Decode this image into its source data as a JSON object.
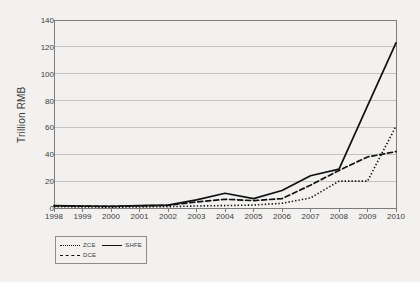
{
  "chart_data": {
    "type": "line",
    "title": "",
    "xlabel": "",
    "ylabel": "Trillion RMB",
    "categories": [
      "1998",
      "1999",
      "2000",
      "2001",
      "2002",
      "2003",
      "2004",
      "2005",
      "2006",
      "2007",
      "2008",
      "2009",
      "2010"
    ],
    "x": [
      1998,
      1999,
      2000,
      2001,
      2002,
      2003,
      2004,
      2005,
      2006,
      2007,
      2008,
      2009,
      2010
    ],
    "xlim": [
      1998,
      2010
    ],
    "ylim": [
      0,
      140
    ],
    "yticks": [
      0,
      20,
      40,
      60,
      80,
      100,
      120,
      140
    ],
    "ytick_labels": [
      "0",
      "20",
      "40",
      "60",
      "80",
      "100",
      "120",
      "140"
    ],
    "grid": "horizontal",
    "legend_position": "below-left",
    "series": [
      {
        "name": "ZCE",
        "style": "dotted",
        "color": "#111111",
        "values": [
          1.0,
          0.8,
          0.6,
          0.8,
          1.0,
          1.5,
          1.8,
          2.2,
          3.5,
          7.5,
          20.0,
          20.0,
          61.0
        ]
      },
      {
        "name": "DCE",
        "style": "dashed",
        "color": "#111111",
        "values": [
          1.6,
          1.4,
          1.2,
          1.6,
          2.0,
          4.5,
          6.5,
          5.5,
          7.0,
          17.0,
          28.0,
          38.0,
          42.0
        ]
      },
      {
        "name": "SHFE",
        "style": "solid",
        "color": "#111111",
        "values": [
          1.8,
          1.5,
          1.3,
          1.8,
          2.2,
          6.0,
          11.0,
          7.0,
          13.0,
          24.0,
          29.0,
          76.0,
          123.0
        ]
      }
    ]
  },
  "legend": {
    "rows": [
      [
        {
          "label": "ZCE",
          "style": "dotted"
        },
        {
          "label": "SHFE",
          "style": "solid"
        }
      ],
      [
        {
          "label": "DCE",
          "style": "dashed"
        }
      ]
    ]
  }
}
